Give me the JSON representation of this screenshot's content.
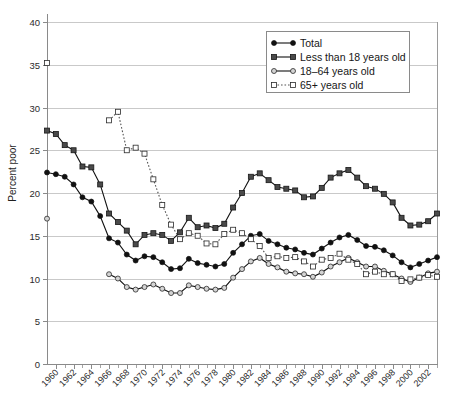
{
  "chart_data": {
    "type": "line",
    "title": "",
    "xlabel": "",
    "ylabel": "Percent poor",
    "xlim": [
      1959,
      2003
    ],
    "ylim": [
      0,
      40
    ],
    "ytick_step": 5,
    "xtick_step": 2,
    "grid": "horizontal",
    "legend_position": "top-right",
    "ytick_labels": [
      "0",
      "5",
      "10",
      "15",
      "20",
      "25",
      "30",
      "35",
      "40"
    ],
    "ytick_values": [
      0,
      5,
      10,
      15,
      20,
      25,
      30,
      35,
      40
    ],
    "xtick_labels": [
      "1960",
      "1962",
      "1964",
      "1966",
      "1968",
      "1970",
      "1972",
      "1974",
      "1976",
      "1978",
      "1980",
      "1982",
      "1984",
      "1986",
      "1988",
      "1990",
      "1992",
      "1994",
      "1996",
      "1998",
      "2000",
      "2002"
    ],
    "xtick_values": [
      1960,
      1962,
      1964,
      1966,
      1968,
      1970,
      1972,
      1974,
      1976,
      1978,
      1980,
      1982,
      1984,
      1986,
      1988,
      1990,
      1992,
      1994,
      1996,
      1998,
      2000,
      2002
    ],
    "series": [
      {
        "name": "Total",
        "marker": "filled-circle",
        "line": "solid",
        "color": "#111111",
        "points": [
          [
            1959,
            22.4
          ],
          [
            1960,
            22.2
          ],
          [
            1961,
            21.9
          ],
          [
            1962,
            21.0
          ],
          [
            1963,
            19.5
          ],
          [
            1964,
            19.0
          ],
          [
            1965,
            17.3
          ],
          [
            1966,
            14.7
          ],
          [
            1967,
            14.2
          ],
          [
            1968,
            12.8
          ],
          [
            1969,
            12.1
          ],
          [
            1970,
            12.6
          ],
          [
            1971,
            12.5
          ],
          [
            1972,
            11.9
          ],
          [
            1973,
            11.1
          ],
          [
            1974,
            11.2
          ],
          [
            1975,
            12.3
          ],
          [
            1976,
            11.8
          ],
          [
            1977,
            11.6
          ],
          [
            1978,
            11.4
          ],
          [
            1979,
            11.7
          ],
          [
            1980,
            13.0
          ],
          [
            1981,
            14.0
          ],
          [
            1982,
            15.0
          ],
          [
            1983,
            15.2
          ],
          [
            1984,
            14.4
          ],
          [
            1985,
            14.0
          ],
          [
            1986,
            13.6
          ],
          [
            1987,
            13.4
          ],
          [
            1988,
            13.0
          ],
          [
            1989,
            12.8
          ],
          [
            1990,
            13.5
          ],
          [
            1991,
            14.2
          ],
          [
            1992,
            14.8
          ],
          [
            1993,
            15.1
          ],
          [
            1994,
            14.5
          ],
          [
            1995,
            13.8
          ],
          [
            1996,
            13.7
          ],
          [
            1997,
            13.3
          ],
          [
            1998,
            12.7
          ],
          [
            1999,
            11.9
          ],
          [
            2000,
            11.3
          ],
          [
            2001,
            11.7
          ],
          [
            2002,
            12.1
          ],
          [
            2003,
            12.5
          ]
        ]
      },
      {
        "name": "Less than 18 years old",
        "marker": "filled-square",
        "line": "solid",
        "color": "#3a3a3a",
        "points": [
          [
            1959,
            27.3
          ],
          [
            1960,
            26.9
          ],
          [
            1961,
            25.6
          ],
          [
            1962,
            25.0
          ],
          [
            1963,
            23.1
          ],
          [
            1964,
            23.0
          ],
          [
            1965,
            21.0
          ],
          [
            1966,
            17.6
          ],
          [
            1967,
            16.6
          ],
          [
            1968,
            15.6
          ],
          [
            1969,
            14.0
          ],
          [
            1970,
            15.1
          ],
          [
            1971,
            15.3
          ],
          [
            1972,
            15.1
          ],
          [
            1973,
            14.4
          ],
          [
            1974,
            15.4
          ],
          [
            1975,
            17.1
          ],
          [
            1976,
            16.0
          ],
          [
            1977,
            16.2
          ],
          [
            1978,
            15.9
          ],
          [
            1979,
            16.4
          ],
          [
            1980,
            18.3
          ],
          [
            1981,
            20.0
          ],
          [
            1982,
            21.9
          ],
          [
            1983,
            22.3
          ],
          [
            1984,
            21.5
          ],
          [
            1985,
            20.7
          ],
          [
            1986,
            20.5
          ],
          [
            1987,
            20.3
          ],
          [
            1988,
            19.5
          ],
          [
            1989,
            19.6
          ],
          [
            1990,
            20.6
          ],
          [
            1991,
            21.8
          ],
          [
            1992,
            22.3
          ],
          [
            1993,
            22.7
          ],
          [
            1994,
            21.8
          ],
          [
            1995,
            20.8
          ],
          [
            1996,
            20.5
          ],
          [
            1997,
            19.9
          ],
          [
            1998,
            18.9
          ],
          [
            1999,
            17.1
          ],
          [
            2000,
            16.2
          ],
          [
            2001,
            16.3
          ],
          [
            2002,
            16.7
          ],
          [
            2003,
            17.6
          ]
        ]
      },
      {
        "name": "18–64 years old",
        "marker": "open-circle",
        "line": "solid",
        "color": "#6f6f6f",
        "points": [
          [
            1959,
            17.0
          ],
          [
            1966,
            10.5
          ],
          [
            1967,
            10.0
          ],
          [
            1968,
            9.0
          ],
          [
            1969,
            8.7
          ],
          [
            1970,
            9.0
          ],
          [
            1971,
            9.3
          ],
          [
            1972,
            8.8
          ],
          [
            1973,
            8.3
          ],
          [
            1974,
            8.3
          ],
          [
            1975,
            9.2
          ],
          [
            1976,
            9.0
          ],
          [
            1977,
            8.8
          ],
          [
            1978,
            8.7
          ],
          [
            1979,
            8.9
          ],
          [
            1980,
            10.1
          ],
          [
            1981,
            11.1
          ],
          [
            1982,
            12.0
          ],
          [
            1983,
            12.4
          ],
          [
            1984,
            11.7
          ],
          [
            1985,
            11.3
          ],
          [
            1986,
            10.8
          ],
          [
            1987,
            10.6
          ],
          [
            1988,
            10.5
          ],
          [
            1989,
            10.2
          ],
          [
            1990,
            10.7
          ],
          [
            1991,
            11.4
          ],
          [
            1992,
            11.9
          ],
          [
            1993,
            12.4
          ],
          [
            1994,
            11.9
          ],
          [
            1995,
            11.4
          ],
          [
            1996,
            11.4
          ],
          [
            1997,
            10.9
          ],
          [
            1998,
            10.5
          ],
          [
            1999,
            10.0
          ],
          [
            2000,
            9.6
          ],
          [
            2001,
            10.1
          ],
          [
            2002,
            10.6
          ],
          [
            2003,
            10.8
          ]
        ]
      },
      {
        "name": "65+ years old",
        "marker": "open-square",
        "line": "dotted",
        "color": "#5a5a5a",
        "points": [
          [
            1959,
            35.2
          ],
          [
            1966,
            28.5
          ],
          [
            1967,
            29.5
          ],
          [
            1968,
            25.0
          ],
          [
            1969,
            25.3
          ],
          [
            1970,
            24.6
          ],
          [
            1971,
            21.6
          ],
          [
            1972,
            18.6
          ],
          [
            1973,
            16.3
          ],
          [
            1974,
            14.6
          ],
          [
            1975,
            15.3
          ],
          [
            1976,
            15.0
          ],
          [
            1977,
            14.1
          ],
          [
            1978,
            14.0
          ],
          [
            1979,
            15.2
          ],
          [
            1980,
            15.7
          ],
          [
            1981,
            15.3
          ],
          [
            1982,
            14.6
          ],
          [
            1983,
            13.8
          ],
          [
            1984,
            12.4
          ],
          [
            1985,
            12.6
          ],
          [
            1986,
            12.4
          ],
          [
            1987,
            12.5
          ],
          [
            1988,
            12.0
          ],
          [
            1989,
            11.4
          ],
          [
            1990,
            12.2
          ],
          [
            1991,
            12.4
          ],
          [
            1992,
            12.9
          ],
          [
            1993,
            12.2
          ],
          [
            1994,
            11.7
          ],
          [
            1995,
            10.5
          ],
          [
            1996,
            10.8
          ],
          [
            1997,
            10.5
          ],
          [
            1998,
            10.5
          ],
          [
            1999,
            9.7
          ],
          [
            2000,
            9.9
          ],
          [
            2001,
            10.1
          ],
          [
            2002,
            10.4
          ],
          [
            2003,
            10.2
          ]
        ]
      }
    ]
  },
  "legend": {
    "items": [
      {
        "label": "Total"
      },
      {
        "label": "Less than 18 years old"
      },
      {
        "label": "18–64 years old"
      },
      {
        "label": "65+ years old"
      }
    ]
  },
  "axes": {
    "y_title": "Percent poor"
  }
}
